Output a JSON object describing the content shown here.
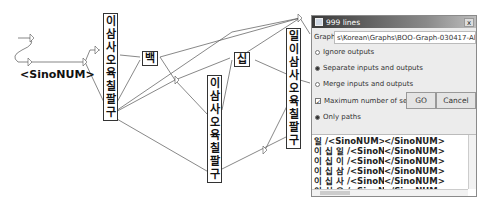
{
  "graph": {
    "start_label": "<SinoNUM>",
    "box1": [
      "이",
      "삼",
      "사",
      "오",
      "육",
      "칠",
      "팔",
      "구"
    ],
    "box_baek": "백",
    "box2": [
      "이",
      "삼",
      "사",
      "오",
      "육",
      "칠",
      "팔",
      "구"
    ],
    "box_sip": "십",
    "box3": [
      "일",
      "이",
      "삼",
      "사",
      "오",
      "육",
      "칠",
      "팔",
      "구"
    ]
  },
  "dialog": {
    "title": "999 lines",
    "close": "x",
    "graph_label": "Graph:",
    "graph_path": "s\\Korean\\Graphs\\BOO-Graph-030417-All-Sam",
    "options": [
      {
        "label": "Ignore outputs",
        "selected": false
      },
      {
        "label": "Separate inputs and outputs",
        "selected": true
      },
      {
        "label": "Merge inputs and outputs",
        "selected": false
      }
    ],
    "max_label": "Maximum number of sequen",
    "max_checked": true,
    "go": "GO",
    "cancel": "Cancel",
    "only_paths": "Only paths",
    "results": [
      {
        "input": "일 /<SinoNUM>",
        "output": "</SinoNUM>"
      },
      {
        "input": "이 십 일 /<SinoNUM>",
        "output": "</SinoNUM>"
      },
      {
        "input": "이 십 이 /<SinoNUM>",
        "output": "</SinoNUM>"
      },
      {
        "input": "이 십 삼 /<SinoNUM>",
        "output": "</SinoNUM>"
      },
      {
        "input": "이 십 사 /<SinoNUM>",
        "output": "</SinoNUM>"
      },
      {
        "input": "이 십 오 /<SinoNUM>",
        "output": "</SinoNUM>"
      }
    ]
  }
}
